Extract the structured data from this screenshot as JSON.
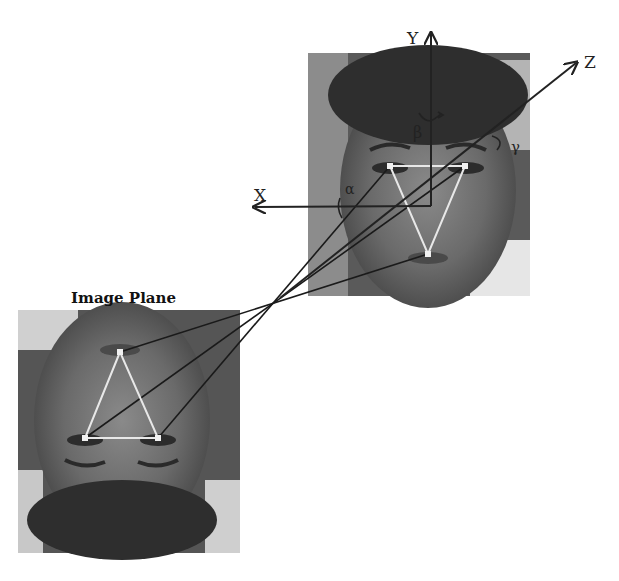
{
  "labels": {
    "image_plane": "Image Plane",
    "axis_x": "X",
    "axis_y": "Y",
    "axis_z": "Z",
    "angle_alpha": "α",
    "angle_beta": "β",
    "angle_gamma": "γ"
  },
  "colors": {
    "background": "#ffffff",
    "axis": "#222222",
    "ray": "#1a1a1a",
    "triangle": "#e8e8e8",
    "photo_dark": "#3a3a3a",
    "photo_mid": "#6e6e6e",
    "photo_light": "#9a9a9a"
  },
  "scene": {
    "head_photo": {
      "x": 308,
      "y": 53,
      "w": 222,
      "h": 243
    },
    "image_plane_photo": {
      "x": 18,
      "y": 310,
      "w": 222,
      "h": 243
    },
    "origin": [
      431,
      206
    ],
    "focal_point": [
      280,
      298
    ],
    "head_points": {
      "left_eye": [
        390,
        166
      ],
      "right_eye": [
        465,
        166
      ],
      "mouth": [
        428,
        254
      ]
    },
    "image_points": {
      "mouth": [
        120,
        352
      ],
      "left_eye": [
        85,
        438
      ],
      "right_eye": [
        158,
        438
      ]
    }
  }
}
